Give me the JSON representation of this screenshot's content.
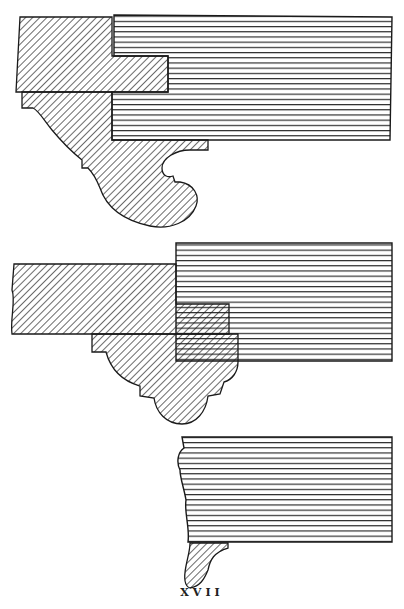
{
  "plate": {
    "caption": "XVII",
    "colors": {
      "background": "#ffffff",
      "ink": "#1a1a1a"
    }
  },
  "figures": [
    {
      "name": "figure-1",
      "description": "Cornice section with large scroll bracket (ogee moulding) beneath horizontal plank and cross-hatched member"
    },
    {
      "name": "figure-2",
      "description": "Cornice section with cross-hatched beam and cymatium moulding beneath"
    },
    {
      "name": "figure-3",
      "description": "Horizontal grained plank with small ogee moulding at lower left"
    }
  ]
}
